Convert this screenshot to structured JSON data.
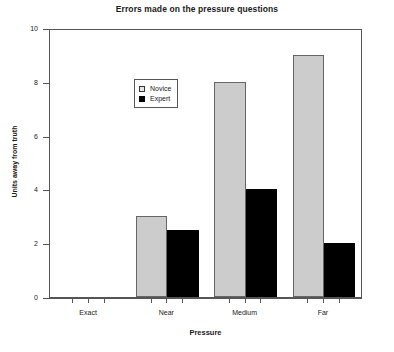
{
  "chart_data": {
    "type": "bar",
    "title": "Errors made on the pressure questions",
    "xlabel": "Pressure",
    "ylabel": "Units away from truth",
    "categories": [
      "Exact",
      "Near",
      "Medium",
      "Far"
    ],
    "series": [
      {
        "name": "Novice",
        "color": "#cccccc",
        "values": [
          0,
          3,
          8,
          9
        ]
      },
      {
        "name": "Expert",
        "color": "#000000",
        "values": [
          0,
          2.5,
          4,
          2
        ]
      }
    ],
    "ylim": [
      0,
      10
    ],
    "yticks": [
      0,
      2,
      4,
      6,
      8,
      10
    ],
    "ytick_labels": [
      "0",
      "2",
      "4",
      "6",
      "8",
      "10"
    ],
    "grid": false,
    "legend_position": "upper-left-inside",
    "legend_entries": [
      "Novice",
      "Expert"
    ]
  }
}
